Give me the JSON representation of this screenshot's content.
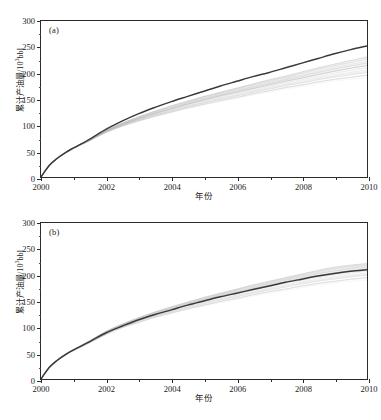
{
  "figure": {
    "panels": [
      {
        "id": "a",
        "label": "(a)"
      },
      {
        "id": "b",
        "label": "(b)"
      }
    ],
    "caption_partial": ""
  },
  "axes": {
    "xlabel": "年份",
    "ylabel_main": "累计产油量/10",
    "ylabel_exponent": "3",
    "ylabel_unit": "bbl",
    "xticks": [
      "2000",
      "2002",
      "2004",
      "2006",
      "2008",
      "2010"
    ],
    "yticks": [
      "0",
      "50",
      "100",
      "150",
      "200",
      "250",
      "300"
    ]
  },
  "colors": {
    "main_curve": "#3a3a3a",
    "ensemble": "#b9b9b9",
    "frame": "#2b2b2b",
    "text": "#1a1a1a"
  },
  "chart_data": [
    {
      "type": "line",
      "panel": "(a)",
      "title": "",
      "xlabel": "年份",
      "ylabel": "累计产油量/10^3 bbl",
      "xlim": [
        2000,
        2010
      ],
      "ylim": [
        0,
        300
      ],
      "xticks": [
        2000,
        2002,
        2004,
        2006,
        2008,
        2010
      ],
      "yticks": [
        0,
        50,
        100,
        150,
        200,
        250,
        300
      ],
      "grid": false,
      "legend": null,
      "x": [
        2000,
        2000.25,
        2000.5,
        2000.75,
        2001,
        2001.5,
        2002,
        2002.5,
        2003,
        2003.5,
        2004,
        2004.5,
        2005,
        2005.5,
        2006,
        2006.5,
        2007,
        2007.5,
        2008,
        2008.5,
        2009,
        2009.5,
        2010
      ],
      "series": [
        {
          "name": "history match / forecast (dark)",
          "role": "main",
          "values": [
            0,
            22,
            36,
            47,
            56,
            73,
            92,
            108,
            122,
            134,
            145,
            155,
            165,
            175,
            184,
            193,
            201,
            210,
            219,
            228,
            237,
            245,
            252
          ]
        },
        {
          "name": "ensemble upper bound",
          "role": "envelope-high",
          "values": [
            0,
            22,
            36,
            47,
            56,
            72,
            90,
            104,
            116,
            127,
            137,
            146,
            155,
            163,
            171,
            179,
            187,
            194,
            202,
            210,
            217,
            224,
            231
          ]
        },
        {
          "name": "ensemble median",
          "role": "envelope-mid",
          "values": [
            0,
            22,
            36,
            47,
            56,
            71,
            88,
            101,
            112,
            122,
            131,
            140,
            148,
            156,
            163,
            170,
            177,
            184,
            190,
            197,
            203,
            209,
            214
          ]
        },
        {
          "name": "ensemble lower bound",
          "role": "envelope-low",
          "values": [
            0,
            21,
            35,
            46,
            55,
            70,
            86,
            98,
            108,
            117,
            125,
            133,
            140,
            147,
            153,
            160,
            166,
            172,
            177,
            183,
            188,
            192,
            196
          ]
        }
      ]
    },
    {
      "type": "line",
      "panel": "(b)",
      "title": "",
      "xlabel": "年份",
      "ylabel": "累计产油量/10^3 bbl",
      "xlim": [
        2000,
        2010
      ],
      "ylim": [
        0,
        300
      ],
      "xticks": [
        2000,
        2002,
        2004,
        2006,
        2008,
        2010
      ],
      "yticks": [
        0,
        50,
        100,
        150,
        200,
        250,
        300
      ],
      "grid": false,
      "legend": null,
      "x": [
        2000,
        2000.25,
        2000.5,
        2000.75,
        2001,
        2001.5,
        2002,
        2002.5,
        2003,
        2003.5,
        2004,
        2004.5,
        2005,
        2005.5,
        2006,
        2006.5,
        2007,
        2007.5,
        2008,
        2008.5,
        2009,
        2009.5,
        2010
      ],
      "series": [
        {
          "name": "history match / forecast (dark)",
          "role": "main",
          "values": [
            0,
            22,
            36,
            47,
            56,
            72,
            89,
            102,
            114,
            124,
            133,
            142,
            150,
            158,
            165,
            172,
            179,
            186,
            192,
            198,
            203,
            207,
            210
          ]
        },
        {
          "name": "ensemble upper bound",
          "role": "envelope-high",
          "values": [
            0,
            22,
            37,
            48,
            57,
            74,
            92,
            106,
            118,
            129,
            139,
            148,
            157,
            165,
            173,
            181,
            188,
            195,
            202,
            209,
            215,
            219,
            222
          ]
        },
        {
          "name": "ensemble median",
          "role": "envelope-mid",
          "values": [
            0,
            22,
            36,
            47,
            56,
            72,
            89,
            103,
            115,
            125,
            134,
            143,
            151,
            159,
            166,
            173,
            180,
            187,
            193,
            199,
            204,
            208,
            211
          ]
        },
        {
          "name": "ensemble lower bound",
          "role": "envelope-low",
          "values": [
            0,
            21,
            35,
            46,
            55,
            70,
            86,
            99,
            109,
            119,
            127,
            135,
            142,
            149,
            155,
            162,
            168,
            173,
            179,
            184,
            188,
            192,
            195
          ]
        }
      ]
    }
  ]
}
